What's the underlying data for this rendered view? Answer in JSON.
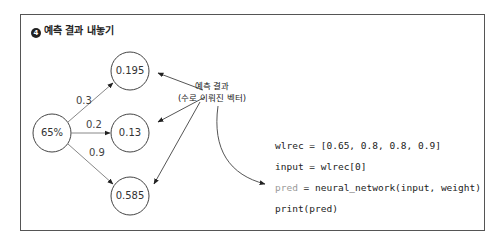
{
  "title": {
    "number": "4",
    "text": "예측 결과 내놓기"
  },
  "input_node": {
    "label": "65%"
  },
  "output_nodes": [
    {
      "label": "0.195",
      "weight": "0.3"
    },
    {
      "label": "0.13",
      "weight": "0.2"
    },
    {
      "label": "0.585",
      "weight": "0.9"
    }
  ],
  "callout": {
    "line1": "예측 결과",
    "line2": "(수로 이뤄진 벡터)"
  },
  "code": {
    "line1": "wlrec = [0.65, 0.8, 0.8, 0.9]",
    "line2": "input = wlrec[0]",
    "line3_var": "pred",
    "line3_rest": " = neural_network(input, weight)",
    "line4": "print(pred)"
  }
}
